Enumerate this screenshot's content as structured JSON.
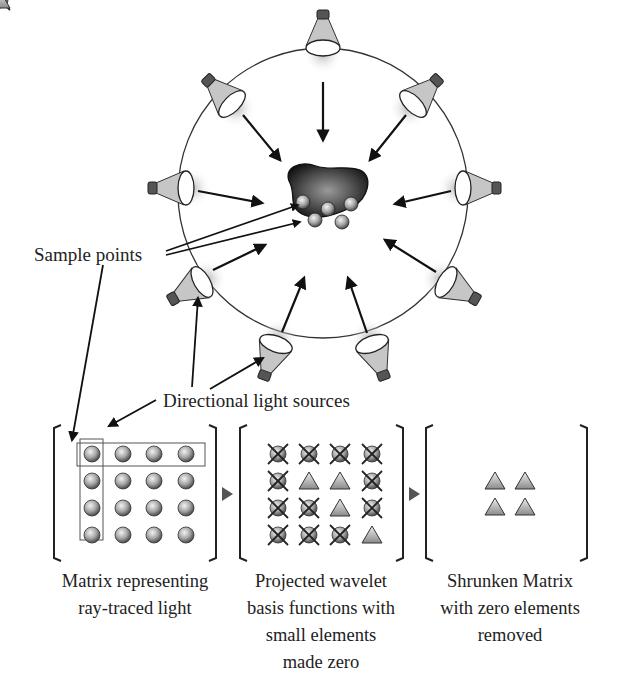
{
  "labels": {
    "sample_points": "Sample points",
    "directional_light_sources": "Directional light sources"
  },
  "captions": {
    "matrix_1": [
      "Matrix representing",
      "ray-traced light"
    ],
    "matrix_2": [
      "Projected wavelet",
      "basis functions with",
      "small elements",
      "made zero"
    ],
    "matrix_3": [
      "Shrunken Matrix",
      "with zero elements",
      "removed"
    ]
  },
  "diagram": {
    "light_source_count": 10,
    "sample_point_count": 5,
    "matrix_1": {
      "rows": 4,
      "cols": 4,
      "element": "sphere",
      "highlight": [
        "row 1",
        "column 1"
      ]
    },
    "matrix_2": {
      "rows": 4,
      "cols": 4,
      "grid": [
        [
          "x",
          "x",
          "x",
          "x"
        ],
        [
          "x",
          "t",
          "t",
          "x"
        ],
        [
          "x",
          "x",
          "t",
          "x"
        ],
        [
          "x",
          "x",
          "x",
          "t"
        ]
      ],
      "legend": {
        "x": "zeroed element (crossed sphere)",
        "t": "retained element (triangle)"
      }
    },
    "matrix_3": {
      "rows": 2,
      "cols": 2,
      "element": "triangle"
    }
  },
  "colors": {
    "line": "#222222",
    "sphere": "#9a9a9a",
    "lamp": "#c8c8c8",
    "arrow_marker": "#555555"
  }
}
